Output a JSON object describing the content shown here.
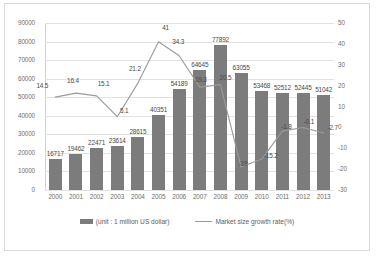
{
  "chart_data": {
    "type": "bar",
    "title": "",
    "xlabel": "",
    "ylabel": "",
    "categories": [
      "2000",
      "2001",
      "2002",
      "2003",
      "2004",
      "2005",
      "2006",
      "2007",
      "2008",
      "2009",
      "2010",
      "2011",
      "2012",
      "2013"
    ],
    "series": [
      {
        "name": "(unit : 1 million US dollar)",
        "type": "bar",
        "axis": "left",
        "color": "#7c7c7c",
        "values": [
          16717,
          19462,
          22471,
          23614,
          28615,
          40351,
          54189,
          64645,
          77892,
          63055,
          53468,
          52512,
          52445,
          51042
        ]
      },
      {
        "name": "Market size growth rate(%)",
        "type": "line",
        "axis": "right",
        "color": "#9a9a9a",
        "values": [
          14.5,
          16.4,
          15.1,
          5.1,
          21.2,
          41,
          34.3,
          19.3,
          20.5,
          -19,
          -15.2,
          -1.8,
          -0.1,
          -2.7
        ]
      }
    ],
    "left_axis": {
      "ticks": [
        "0",
        "10000",
        "20000",
        "30000",
        "40000",
        "50000",
        "60000",
        "70000",
        "80000",
        "90000"
      ],
      "min": 0,
      "max": 90000
    },
    "right_axis": {
      "ticks": [
        "-30",
        "-20",
        "-10",
        "0",
        "10",
        "20",
        "30",
        "40",
        "50"
      ],
      "min": -30,
      "max": 50
    },
    "grid": true,
    "legend_position": "bottom",
    "legend": [
      {
        "label": "(unit : 1 million US dollar)",
        "marker": "bar-swatch"
      },
      {
        "label": "Market size growth rate(%)",
        "marker": "line-swatch"
      }
    ]
  }
}
